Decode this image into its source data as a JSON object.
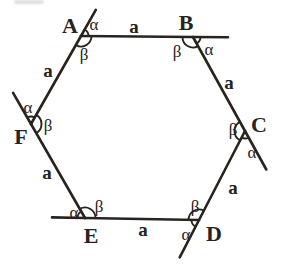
{
  "diagram": {
    "ink_color": "#29231e",
    "background_color": "#ffffff",
    "canvas": {
      "width": 282,
      "height": 268
    },
    "alpha_symbol": "α",
    "beta_symbol": "β",
    "angle_arcs": {
      "alpha_radius": 7.5,
      "beta_radius": 10.5
    },
    "vertices": [
      {
        "id": "A",
        "x": 81,
        "y": 36,
        "label": "A",
        "label_x": 70,
        "label_y": 25,
        "alpha_x": 94,
        "alpha_y": 24,
        "beta_x": 84,
        "beta_y": 54,
        "ext_len": 30
      },
      {
        "id": "B",
        "x": 193,
        "y": 37,
        "label": "B",
        "label_x": 186,
        "label_y": 22,
        "alpha_x": 209,
        "alpha_y": 49,
        "beta_x": 177,
        "beta_y": 51,
        "ext_len": 35
      },
      {
        "id": "C",
        "x": 245,
        "y": 131,
        "label": "C",
        "label_x": 259,
        "label_y": 124,
        "alpha_x": 252,
        "alpha_y": 152,
        "beta_x": 233,
        "beta_y": 129,
        "ext_len": 44
      },
      {
        "id": "D",
        "x": 199,
        "y": 220,
        "label": "D",
        "label_x": 214,
        "label_y": 233,
        "alpha_x": 186,
        "alpha_y": 234,
        "beta_x": 195,
        "beta_y": 206,
        "ext_len": 42
      },
      {
        "id": "E",
        "x": 85,
        "y": 218,
        "label": "E",
        "label_x": 91,
        "label_y": 235,
        "alpha_x": 74,
        "alpha_y": 212,
        "beta_x": 99,
        "beta_y": 206,
        "ext_len": 33
      },
      {
        "id": "F",
        "x": 31,
        "y": 124,
        "label": "F",
        "label_x": 21,
        "label_y": 136,
        "alpha_x": 28,
        "alpha_y": 107,
        "beta_x": 48,
        "beta_y": 125,
        "ext_len": 36
      }
    ],
    "sides": [
      {
        "from": "A",
        "to": "B",
        "label": "a",
        "label_x": 134,
        "label_y": 26
      },
      {
        "from": "B",
        "to": "C",
        "label": "a",
        "label_x": 229,
        "label_y": 82
      },
      {
        "from": "C",
        "to": "D",
        "label": "a",
        "label_x": 233,
        "label_y": 187
      },
      {
        "from": "D",
        "to": "E",
        "label": "a",
        "label_x": 143,
        "label_y": 229
      },
      {
        "from": "E",
        "to": "F",
        "label": "a",
        "label_x": 47,
        "label_y": 172
      },
      {
        "from": "F",
        "to": "A",
        "label": "a",
        "label_x": 48,
        "label_y": 70
      }
    ]
  }
}
